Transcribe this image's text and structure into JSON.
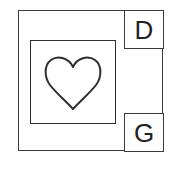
{
  "diagram": {
    "labels": {
      "top_right": "D",
      "bottom_right": "G"
    },
    "center_icon": "heart-icon",
    "colors": {
      "stroke": "#2e2e2e",
      "background": "#ffffff"
    }
  }
}
